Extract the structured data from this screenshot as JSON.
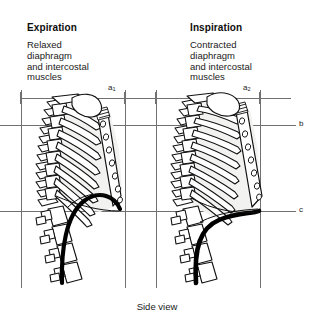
{
  "figure": {
    "caption": "Side view",
    "width": 314,
    "height": 325,
    "background_color": "#ffffff"
  },
  "panels": [
    {
      "id": "expiration",
      "title": "Expiration",
      "description": "Relaxed\ndiaphragm\nand intercostal\nmuscles",
      "state": "relaxed",
      "diaphragm_shape": "domed / raised",
      "rib_orientation": "depressed, sloping downward",
      "sternum_position": "lowered"
    },
    {
      "id": "inspiration",
      "title": "Inspiration",
      "description": "Contracted\ndiaphragm\nand intercostal\nmuscles",
      "state": "contracted",
      "diaphragm_shape": "flattened / lowered",
      "rib_orientation": "elevated, more horizontal",
      "sternum_position": "raised and forward"
    }
  ],
  "reference_lines": {
    "horizontal": [
      {
        "label": "a",
        "y": 98,
        "note": "upper thoracic reference level"
      },
      {
        "label": "b",
        "y": 125,
        "note": "mid thoracic reference level"
      },
      {
        "label": "c",
        "y": 211,
        "note": "diaphragm / costal margin reference level"
      }
    ],
    "vertical": [
      {
        "label": "",
        "x": 21,
        "panel": "expiration",
        "note": "posterior reference"
      },
      {
        "label": "a1",
        "x": 125,
        "panel": "expiration",
        "note": "anterior reference"
      },
      {
        "label": "",
        "x": 156,
        "panel": "inspiration",
        "note": "posterior reference"
      },
      {
        "label": "a2",
        "x": 260,
        "panel": "inspiration",
        "note": "anterior reference"
      }
    ]
  },
  "axis_labels": {
    "a1_base": "a",
    "a1_sub": "1",
    "a2_base": "a",
    "a2_sub": "2",
    "b": "b",
    "c": "c"
  },
  "colors": {
    "ink": "#111111",
    "gridline": "#707070",
    "cavity_fill": "#f2f2f0",
    "bone_fill": "#ffffff",
    "diaphragm": "#000000",
    "background": "#ffffff"
  }
}
